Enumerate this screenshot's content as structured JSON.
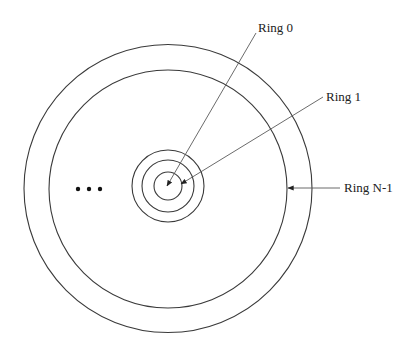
{
  "diagram": {
    "type": "concentric-rings",
    "center": {
      "x": 168,
      "y": 188
    },
    "rings": [
      {
        "name": "inner-ring-small",
        "r": 14
      },
      {
        "name": "middle-ring-small",
        "r": 26
      },
      {
        "name": "outer-ring-small",
        "r": 36
      },
      {
        "name": "large-inner-ring",
        "r": 119
      },
      {
        "name": "large-outer-ring",
        "r": 144
      }
    ],
    "ellipsis": "• • •",
    "labels": {
      "ring0": "Ring 0",
      "ring1": "Ring 1",
      "ringN1": "Ring N-1"
    },
    "colors": {
      "stroke": "#3a3a3a",
      "text": "#222222",
      "background": "#ffffff"
    }
  }
}
